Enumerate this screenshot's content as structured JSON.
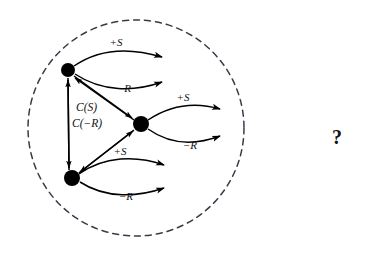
{
  "figure": {
    "background_color": "#ffffff",
    "ink_color": "#000000",
    "boundary_color": "#3a3a46",
    "boundary": {
      "name": "dashed-enclosure",
      "shape": "circle",
      "center_x": 136,
      "center_y": 128,
      "radius": 108,
      "style": "dashed"
    },
    "nodes": [
      {
        "id": "top",
        "label": "",
        "cx": 68,
        "cy": 70,
        "r": 7
      },
      {
        "id": "middle",
        "label": "",
        "cx": 141,
        "cy": 124,
        "r": 8
      },
      {
        "id": "bottom",
        "label": "",
        "cx": 72,
        "cy": 178,
        "r": 8
      }
    ],
    "outcome_edges": [
      {
        "from": "top",
        "label": "+S",
        "label_x": 116,
        "label_y": 46,
        "tip_x": 166,
        "tip_y": 58
      },
      {
        "from": "top",
        "label": "−R",
        "label_x": 124,
        "label_y": 92,
        "tip_x": 166,
        "tip_y": 82
      },
      {
        "from": "middle",
        "label": "+S",
        "label_x": 183,
        "label_y": 101,
        "tip_x": 224,
        "tip_y": 110
      },
      {
        "from": "middle",
        "label": "−R",
        "label_x": 190,
        "label_y": 149,
        "tip_x": 224,
        "tip_y": 136
      },
      {
        "from": "bottom",
        "label": "+S",
        "label_x": 120,
        "label_y": 155,
        "tip_x": 168,
        "tip_y": 166
      },
      {
        "from": "bottom",
        "label": "−R",
        "label_x": 126,
        "label_y": 200,
        "tip_x": 168,
        "tip_y": 188
      }
    ],
    "transition_edges": [
      {
        "from": "top",
        "to": "middle",
        "kind": "straight"
      },
      {
        "from": "middle",
        "to": "top",
        "kind": "straight"
      },
      {
        "from": "bottom",
        "to": "middle",
        "kind": "straight"
      },
      {
        "from": "middle",
        "to": "bottom",
        "kind": "straight"
      },
      {
        "from": "top",
        "to": "bottom",
        "kind": "bidirectional-vertical"
      }
    ],
    "cost_labels": [
      {
        "text": "C(S)",
        "x": 76,
        "y": 111
      },
      {
        "text": "C(−R)",
        "x": 72,
        "y": 127
      }
    ],
    "annotation": {
      "name": "question-mark",
      "text": "?",
      "x": 337,
      "y": 144
    }
  }
}
